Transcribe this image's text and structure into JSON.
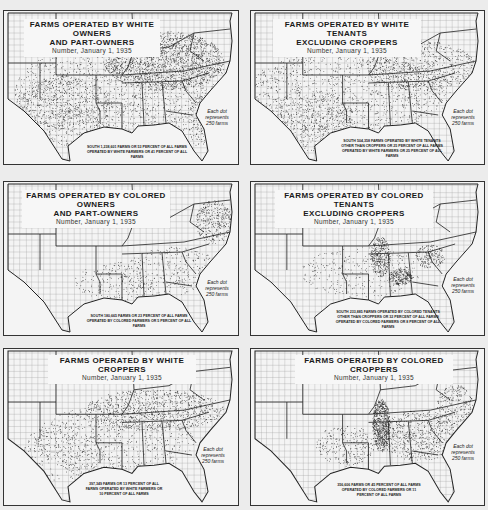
{
  "figure": {
    "panels": [
      {
        "id": "white-owners",
        "title_lines": [
          "Farms Operated by White Owners",
          "and Part-Owners"
        ],
        "subtitle": "Number, January 1, 1935",
        "legend": [
          "Each dot",
          "represents",
          "250 farms"
        ],
        "note": "South 1,238,601 farms or 53 percent of all farms operated by white farmers or 41 percent of all farms",
        "density": "very high in Appalachian / upper South, moderate elsewhere"
      },
      {
        "id": "white-tenants",
        "title_lines": [
          "Farms Operated by White Tenants",
          "Excluding Croppers"
        ],
        "subtitle": "Number, January 1, 1935",
        "legend": [
          "Each dot",
          "represents",
          "250 farms"
        ],
        "note": "South 504,358 farms operated by white tenants other than croppers or 25 percent of all farms operated by white farmers or 25 percent of all farms",
        "density": "moderate and widespread, heavier in Texas, Oklahoma, Kentucky, Tennessee"
      },
      {
        "id": "colored-owners",
        "title_lines": [
          "Farms Operated by Colored Owners",
          "and Part-Owners"
        ],
        "subtitle": "Number, January 1, 1935",
        "legend": [
          "Each dot",
          "represents",
          "250 farms"
        ],
        "note": "South 180,665 farms or 23 percent of all farms operated by colored farmers or 5 percent of all farms",
        "density": "sparse, concentrated in Virginia / Carolinas coastal plain"
      },
      {
        "id": "colored-tenants",
        "title_lines": [
          "Farms Operated by Colored Tenants",
          "Excluding Croppers"
        ],
        "subtitle": "Number, January 1, 1935",
        "legend": [
          "Each dot",
          "represents",
          "250 farms"
        ],
        "note": "South 233,885 farms operated by colored tenants other than croppers or 32 percent of all farms operated by colored farmers or 8 percent of all farms",
        "density": "clusters in Mississippi Delta, Alabama Black Belt, South Carolina"
      },
      {
        "id": "white-croppers",
        "title_lines": [
          "Farms Operated by White Croppers"
        ],
        "subtitle": "Number, January 1, 1935",
        "legend": [
          "Each dot",
          "represents",
          "250 farms"
        ],
        "note": "397,349 farms or 13 percent of all farms operated by white farmers or 10 percent of all farms",
        "density": "moderate, heavier in Tennessee, North Carolina, Georgia"
      },
      {
        "id": "colored-croppers",
        "title_lines": [
          "Farms Operated by Colored Croppers"
        ],
        "subtitle": "Number, January 1, 1935",
        "legend": [
          "Each dot",
          "represents",
          "250 farms"
        ],
        "note": "356,606 farms or 45 percent of all farms operated by colored farmers or 11 percent of all farms",
        "density": "very dense in Mississippi Delta, heavy in Georgia / Carolinas"
      }
    ]
  }
}
